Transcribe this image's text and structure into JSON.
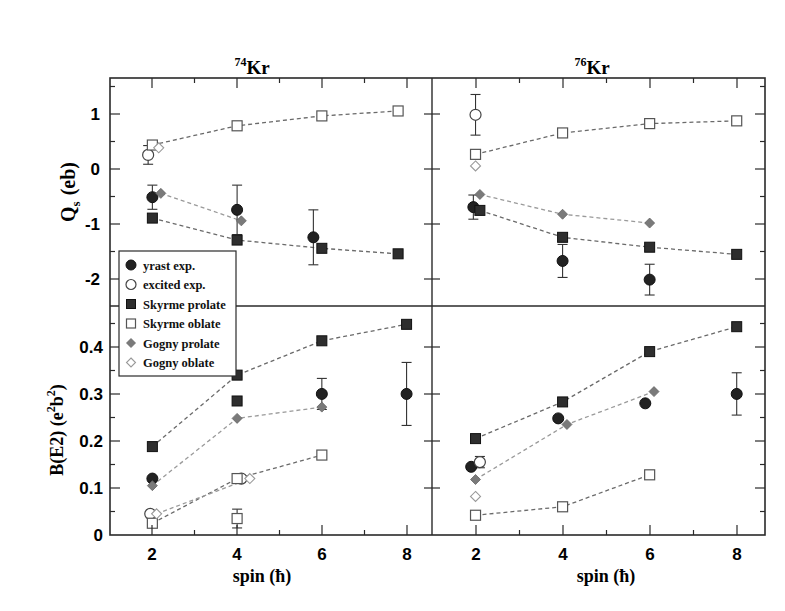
{
  "chart_data": [
    {
      "type": "scatter",
      "panel": "top-left",
      "title": "74Kr",
      "title_mass": "74",
      "title_element": "Kr",
      "xlabel": "spin (ħ)",
      "ylabel": "Q_s (eb)",
      "xlim": [
        1,
        8.6
      ],
      "ylim": [
        -2.5,
        1.65
      ],
      "yticks": [
        -2,
        -1,
        0,
        1
      ],
      "series": [
        {
          "name": "yrast exp.",
          "marker": "filled-circle",
          "points": [
            {
              "x": 2,
              "y": -0.52,
              "err": 0.22
            },
            {
              "x": 4,
              "y": -0.75,
              "err": 0.45
            },
            {
              "x": 5.8,
              "y": -1.25,
              "err": 0.5
            }
          ]
        },
        {
          "name": "excited exp.",
          "marker": "open-circle",
          "points": [
            {
              "x": 1.9,
              "y": 0.25,
              "err": 0.17
            }
          ]
        },
        {
          "name": "Skyrme prolate",
          "marker": "filled-square",
          "line": true,
          "points": [
            {
              "x": 2,
              "y": -0.9
            },
            {
              "x": 4,
              "y": -1.3
            },
            {
              "x": 6,
              "y": -1.45
            },
            {
              "x": 7.8,
              "y": -1.55
            }
          ]
        },
        {
          "name": "Skyrme oblate",
          "marker": "open-square",
          "line": true,
          "points": [
            {
              "x": 2,
              "y": 0.43
            },
            {
              "x": 4,
              "y": 0.78
            },
            {
              "x": 6,
              "y": 0.96
            },
            {
              "x": 7.8,
              "y": 1.05
            }
          ]
        },
        {
          "name": "Gogny prolate",
          "marker": "filled-diamond",
          "line": true,
          "points": [
            {
              "x": 2.2,
              "y": -0.45
            },
            {
              "x": 4.1,
              "y": -0.95
            }
          ]
        },
        {
          "name": "Gogny oblate",
          "marker": "open-diamond",
          "points": [
            {
              "x": 2.15,
              "y": 0.38
            }
          ]
        }
      ]
    },
    {
      "type": "scatter",
      "panel": "top-right",
      "title": "76Kr",
      "title_mass": "76",
      "title_element": "Kr",
      "xlabel": "spin (ħ)",
      "ylabel": "Q_s (eb)",
      "xlim": [
        1,
        8.65
      ],
      "ylim": [
        -2.5,
        1.65
      ],
      "series": [
        {
          "name": "yrast exp.",
          "marker": "filled-circle",
          "points": [
            {
              "x": 1.95,
              "y": -0.7,
              "err": 0.22
            },
            {
              "x": 4,
              "y": -1.68,
              "err": 0.3
            },
            {
              "x": 6,
              "y": -2.02,
              "err": 0.28
            }
          ]
        },
        {
          "name": "excited exp.",
          "marker": "open-circle",
          "points": [
            {
              "x": 2,
              "y": 0.98,
              "err": 0.37
            }
          ]
        },
        {
          "name": "Skyrme prolate",
          "marker": "filled-square",
          "line": true,
          "points": [
            {
              "x": 2.1,
              "y": -0.76
            },
            {
              "x": 4,
              "y": -1.25
            },
            {
              "x": 6,
              "y": -1.43
            },
            {
              "x": 8,
              "y": -1.56
            }
          ]
        },
        {
          "name": "Skyrme oblate",
          "marker": "open-square",
          "line": true,
          "points": [
            {
              "x": 2,
              "y": 0.26
            },
            {
              "x": 4,
              "y": 0.65
            },
            {
              "x": 6,
              "y": 0.82
            },
            {
              "x": 8,
              "y": 0.87
            }
          ]
        },
        {
          "name": "Gogny prolate",
          "marker": "filled-diamond",
          "line": true,
          "points": [
            {
              "x": 2.1,
              "y": -0.47
            },
            {
              "x": 4,
              "y": -0.83
            },
            {
              "x": 6,
              "y": -0.99
            }
          ]
        },
        {
          "name": "Gogny oblate",
          "marker": "open-diamond",
          "points": [
            {
              "x": 2,
              "y": 0.05
            }
          ]
        }
      ]
    },
    {
      "type": "scatter",
      "panel": "bottom-left",
      "xlabel": "spin (ħ)",
      "ylabel": "B(E2) (e²b²)",
      "xlim": [
        1,
        8.6
      ],
      "ylim": [
        0,
        0.487
      ],
      "xticks": [
        2,
        4,
        6,
        8
      ],
      "yticks": [
        0,
        0.1,
        0.2,
        0.3,
        0.4
      ],
      "series": [
        {
          "name": "yrast exp.",
          "marker": "filled-circle",
          "points": [
            {
              "x": 2,
              "y": 0.12
            },
            {
              "x": 6,
              "y": 0.3,
              "err": 0.033
            },
            {
              "x": 8,
              "y": 0.3,
              "err": 0.067
            }
          ]
        },
        {
          "name": "excited exp.",
          "marker": "open-circle",
          "points": [
            {
              "x": 1.95,
              "y": 0.045
            },
            {
              "x": 4.1,
              "y": 0.12
            }
          ]
        },
        {
          "name": "Skyrme prolate",
          "marker": "filled-square",
          "line": true,
          "points": [
            {
              "x": 2,
              "y": 0.188
            },
            {
              "x": 4,
              "y": 0.34
            },
            {
              "x": 6,
              "y": 0.413
            },
            {
              "x": 8,
              "y": 0.448
            }
          ]
        },
        {
          "name": "Skyrme prolate (extra)",
          "marker": "filled-square",
          "points": [
            {
              "x": 4,
              "y": 0.285
            }
          ]
        },
        {
          "name": "Skyrme oblate",
          "marker": "open-square",
          "line": true,
          "points": [
            {
              "x": 2,
              "y": 0.025
            },
            {
              "x": 4,
              "y": 0.12
            },
            {
              "x": 6,
              "y": 0.17
            }
          ]
        },
        {
          "name": "Skyrme oblate (extra)",
          "marker": "open-square",
          "points": [
            {
              "x": 4,
              "y": 0.035,
              "err": 0.02
            }
          ]
        },
        {
          "name": "Gogny prolate",
          "marker": "filled-diamond",
          "line": true,
          "points": [
            {
              "x": 2,
              "y": 0.105
            },
            {
              "x": 4,
              "y": 0.248
            },
            {
              "x": 6,
              "y": 0.272
            }
          ]
        },
        {
          "name": "Gogny oblate",
          "marker": "open-diamond",
          "line": true,
          "points": [
            {
              "x": 2.1,
              "y": 0.045
            },
            {
              "x": 4.3,
              "y": 0.12
            }
          ]
        }
      ]
    },
    {
      "type": "scatter",
      "panel": "bottom-right",
      "xlabel": "spin (ħ)",
      "ylabel": "B(E2) (e²b²)",
      "xlim": [
        1,
        8.65
      ],
      "ylim": [
        0,
        0.487
      ],
      "xticks": [
        2,
        4,
        6,
        8
      ],
      "series": [
        {
          "name": "yrast exp.",
          "marker": "filled-circle",
          "points": [
            {
              "x": 1.9,
              "y": 0.145
            },
            {
              "x": 3.9,
              "y": 0.248
            },
            {
              "x": 5.9,
              "y": 0.28
            },
            {
              "x": 8,
              "y": 0.3,
              "err": 0.045
            }
          ]
        },
        {
          "name": "excited exp.",
          "marker": "open-circle",
          "points": [
            {
              "x": 2.1,
              "y": 0.155,
              "err": 0.012
            }
          ]
        },
        {
          "name": "Skyrme prolate",
          "marker": "filled-square",
          "line": true,
          "points": [
            {
              "x": 2,
              "y": 0.205
            },
            {
              "x": 4,
              "y": 0.283
            },
            {
              "x": 6,
              "y": 0.39
            },
            {
              "x": 8,
              "y": 0.443
            }
          ]
        },
        {
          "name": "Skyrme oblate",
          "marker": "open-square",
          "line": true,
          "points": [
            {
              "x": 2,
              "y": 0.042
            },
            {
              "x": 4,
              "y": 0.06
            },
            {
              "x": 6,
              "y": 0.128
            }
          ]
        },
        {
          "name": "Gogny prolate",
          "marker": "filled-diamond",
          "line": true,
          "points": [
            {
              "x": 2,
              "y": 0.118
            },
            {
              "x": 4.1,
              "y": 0.235
            },
            {
              "x": 6.1,
              "y": 0.305
            }
          ]
        },
        {
          "name": "Gogny oblate",
          "marker": "open-diamond",
          "points": [
            {
              "x": 2,
              "y": 0.082
            }
          ]
        }
      ]
    }
  ],
  "titles": {
    "left_mass": "74",
    "left_element": "Kr",
    "right_mass": "76",
    "right_element": "Kr"
  },
  "axes": {
    "top_ylabel_main": "Q",
    "top_ylabel_sub": "s",
    "top_ylabel_unit": "(eb)",
    "bottom_ylabel": "B(E2)  (e",
    "bottom_ylabel_sup1": "2",
    "bottom_ylabel_mid": "b",
    "bottom_ylabel_sup2": "2",
    "bottom_ylabel_end": ")",
    "xlabel": "spin  (ħ)",
    "top_yticks": [
      "1",
      "0",
      "-1",
      "-2"
    ],
    "bottom_yticks": [
      "0.4",
      "0.3",
      "0.2",
      "0.1",
      "0"
    ],
    "xticks": [
      "2",
      "4",
      "6",
      "8"
    ]
  },
  "legend": {
    "items": [
      {
        "label": "yrast exp.",
        "marker": "filled-circle"
      },
      {
        "label": "excited exp.",
        "marker": "open-circle"
      },
      {
        "label": "Skyrme prolate",
        "marker": "filled-square"
      },
      {
        "label": "Skyrme oblate",
        "marker": "open-square"
      },
      {
        "label": "Gogny prolate",
        "marker": "filled-diamond"
      },
      {
        "label": "Gogny oblate",
        "marker": "open-diamond"
      }
    ]
  },
  "colors": {
    "frame": "#2a2a2a",
    "exp_fill": "#222222",
    "skyrme_fill": "#2e2e2e",
    "gogny_fill": "#7a7a7a",
    "gogny_line": "#9a9a9a",
    "skyrme_line": "#6a6a6a"
  }
}
